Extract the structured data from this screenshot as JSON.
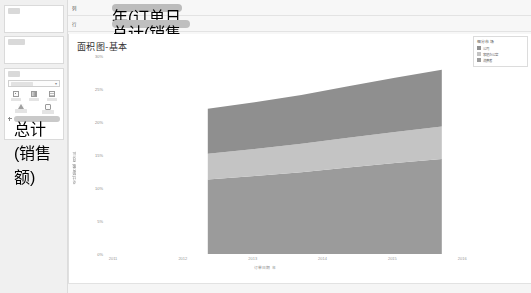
{
  "sidebar": {
    "pages_label": "页面",
    "filters_label": "筛选器",
    "marks_label": "标记",
    "mark_type": "自动",
    "mark_buttons": [
      {
        "name": "color",
        "label": "颜色"
      },
      {
        "name": "size",
        "label": "大小"
      },
      {
        "name": "label",
        "label": "标签"
      },
      {
        "name": "detail",
        "label": "详细信息"
      },
      {
        "name": "tooltip",
        "label": "工具提示"
      }
    ],
    "marks_pill": "总计(销售额)"
  },
  "shelves": {
    "columns_label": "列",
    "rows_label": "行",
    "columns_pill": "年(订单日期)",
    "rows_pill": "总计(销售额) 百分比"
  },
  "worksheet": {
    "title": "面积图-基本"
  },
  "legend": {
    "title": "细分市场",
    "items": [
      {
        "label": "公司",
        "color": "#8f8f8f"
      },
      {
        "label": "家庭办公室",
        "color": "#c4c4c4"
      },
      {
        "label": "消费者",
        "color": "#9b9b9b"
      }
    ]
  },
  "chart_data": {
    "type": "area",
    "title": "面积图-基本",
    "xlabel": "订单日期 年",
    "ylabel": "总计(销售额) 百分比",
    "stacked": true,
    "grid": false,
    "legend_position": "right",
    "x": [
      "2011",
      "2012",
      "2013",
      "2014",
      "2015",
      "2016"
    ],
    "xlim": [
      "2011",
      "2016"
    ],
    "x_tick_labels": [
      "2011",
      "2012",
      "2013",
      "2014",
      "2015",
      "2016"
    ],
    "ylim": [
      0,
      30
    ],
    "y_tick_labels": [
      "0%",
      "5%",
      "10%",
      "15%",
      "20%",
      "25%",
      "30%"
    ],
    "y_ticks": [
      0,
      5,
      10,
      15,
      20,
      25,
      30
    ],
    "series": [
      {
        "name": "消费者",
        "color": "#9b9b9b",
        "values": [
          11.3,
          11.8,
          12.4,
          13.1,
          13.8,
          14.4
        ]
      },
      {
        "name": "家庭办公室",
        "color": "#c4c4c4",
        "values": [
          3.9,
          4.1,
          4.3,
          4.5,
          4.7,
          4.9
        ]
      },
      {
        "name": "公司",
        "color": "#8f8f8f",
        "values": [
          6.8,
          7.1,
          7.4,
          7.8,
          8.2,
          8.6
        ]
      }
    ]
  }
}
